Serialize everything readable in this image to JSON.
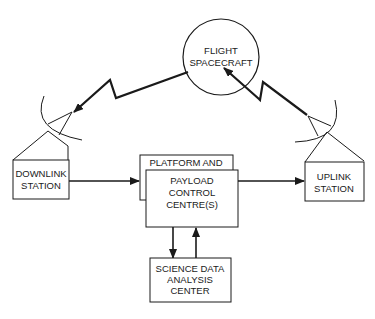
{
  "diagram": {
    "spacecraft": {
      "line1": "FLIGHT",
      "line2": "SPACECRAFT"
    },
    "downlink": {
      "line1": "DOWNLINK",
      "line2": "STATION"
    },
    "uplink": {
      "line1": "UPLINK",
      "line2": "STATION"
    },
    "platform": {
      "label": "PLATFORM AND"
    },
    "payload": {
      "line1": "PAYLOAD",
      "line2": "CONTROL",
      "line3": "CENTRE(S)"
    },
    "science": {
      "line1": "SCIENCE DATA",
      "line2": "ANALYSIS",
      "line3": "CENTER"
    }
  },
  "colors": {
    "stroke": "#1a1a1a",
    "background": "#ffffff"
  }
}
